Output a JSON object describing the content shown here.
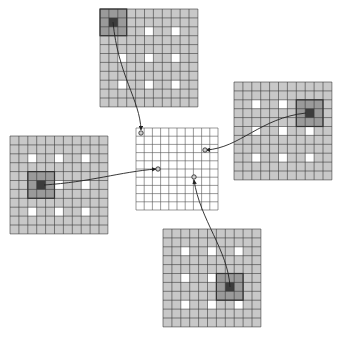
{
  "diagram": {
    "colors": {
      "cell_fill": "#c8c8c8",
      "grid_line": "#3a3a3a",
      "white_cell": "#ffffff",
      "highlight_fill": "#9a9a9a",
      "highlight_center": "#3c3c3c",
      "highlight_border": "#333333",
      "output_fill": "#ffffff",
      "output_line": "#555555",
      "arrow": "#222222",
      "endpoint": "#888888"
    },
    "input_grids": [
      {
        "id": "top",
        "x": 100,
        "y": 9,
        "cols": 11,
        "rows": 11,
        "cell": 8.9,
        "white_cells": [
          [
            2,
            2
          ],
          [
            5,
            2
          ],
          [
            8,
            2
          ],
          [
            2,
            5
          ],
          [
            5,
            5
          ],
          [
            8,
            5
          ],
          [
            2,
            8
          ],
          [
            5,
            8
          ],
          [
            8,
            8
          ]
        ],
        "highlight": {
          "col": 0,
          "row": 0,
          "size": 3
        },
        "arrow": {
          "from": [
            113,
            22
          ],
          "c1": [
            118,
            75
          ],
          "c2": [
            140,
            100
          ],
          "to": [
            141,
            130
          ]
        }
      },
      {
        "id": "right",
        "x": 234,
        "y": 82,
        "cols": 11,
        "rows": 11,
        "cell": 8.9,
        "white_cells": [
          [
            2,
            2
          ],
          [
            5,
            2
          ],
          [
            8,
            2
          ],
          [
            2,
            5
          ],
          [
            5,
            5
          ],
          [
            8,
            5
          ],
          [
            2,
            8
          ],
          [
            5,
            8
          ],
          [
            8,
            8
          ]
        ],
        "highlight": {
          "col": 7,
          "row": 2,
          "size": 3
        },
        "arrow": {
          "from": [
            306,
            113
          ],
          "c1": [
            260,
            118
          ],
          "c2": [
            240,
            148
          ],
          "to": [
            206,
            150
          ]
        }
      },
      {
        "id": "left",
        "x": 10,
        "y": 136,
        "cols": 11,
        "rows": 11,
        "cell": 8.9,
        "white_cells": [
          [
            2,
            2
          ],
          [
            5,
            2
          ],
          [
            8,
            2
          ],
          [
            2,
            5
          ],
          [
            5,
            5
          ],
          [
            8,
            5
          ],
          [
            2,
            8
          ],
          [
            5,
            8
          ],
          [
            8,
            8
          ]
        ],
        "highlight": {
          "col": 2,
          "row": 4,
          "size": 3
        },
        "arrow": {
          "from": [
            44,
            185
          ],
          "c1": [
            90,
            182
          ],
          "c2": [
            120,
            172
          ],
          "to": [
            156,
            169
          ]
        }
      },
      {
        "id": "bottom",
        "x": 163,
        "y": 229,
        "cols": 11,
        "rows": 11,
        "cell": 8.9,
        "white_cells": [
          [
            2,
            2
          ],
          [
            5,
            2
          ],
          [
            8,
            2
          ],
          [
            2,
            5
          ],
          [
            5,
            5
          ],
          [
            8,
            5
          ],
          [
            2,
            8
          ],
          [
            5,
            8
          ],
          [
            8,
            8
          ]
        ],
        "highlight": {
          "col": 6,
          "row": 5,
          "size": 3
        },
        "arrow": {
          "from": [
            230,
            287
          ],
          "c1": [
            228,
            250
          ],
          "c2": [
            200,
            220
          ],
          "to": [
            194,
            180
          ]
        }
      }
    ],
    "output_grid": {
      "id": "center",
      "x": 136,
      "y": 128,
      "cols": 10,
      "rows": 10,
      "cell": 8.2,
      "endpoints": [
        [
          141,
          133
        ],
        [
          205,
          150
        ],
        [
          158,
          169
        ],
        [
          194,
          177
        ]
      ]
    }
  }
}
